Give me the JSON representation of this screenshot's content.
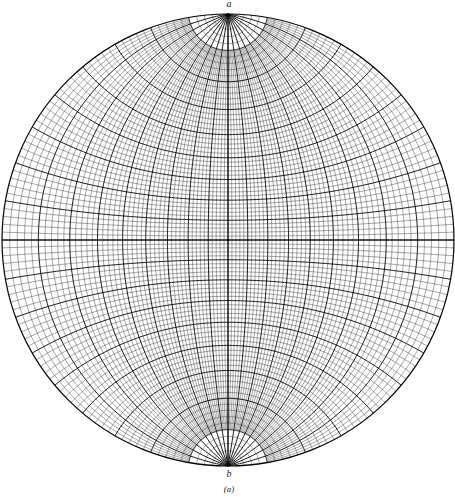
{
  "diagram": {
    "type": "wulff-net",
    "center": [
      228,
      240
    ],
    "radius": 226,
    "minor_interval_deg": 2,
    "major_interval_deg": 10,
    "polar_cutoff_deg": 10,
    "line_color": "#000000"
  },
  "labels": {
    "top_pole": "a",
    "bottom_pole": "b",
    "caption": "(a)"
  }
}
